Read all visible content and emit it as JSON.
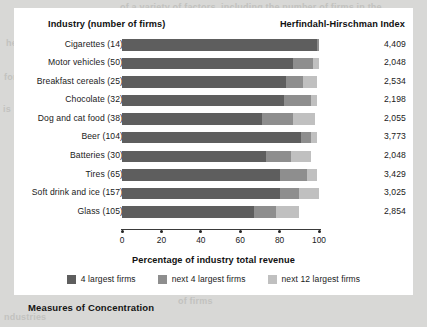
{
  "figure": {
    "caption": "Measures of Concentration",
    "header_left": "Industry (number of firms)",
    "header_right": "Herfindahl-Hirschman Index"
  },
  "colors": {
    "seg1": "#5e5e5e",
    "seg2": "#8e8e8e",
    "seg3": "#c0c0c0",
    "panel": "#ffffff",
    "page": "#d8d8d6",
    "text": "#1a1a1a"
  },
  "legend": [
    {
      "label": "4 largest firms",
      "color": "#5e5e5e",
      "key": "seg1"
    },
    {
      "label": "next 4 largest firms",
      "color": "#8e8e8e",
      "key": "seg2"
    },
    {
      "label": "next 12 largest firms",
      "color": "#c0c0c0",
      "key": "seg3"
    }
  ],
  "axis": {
    "title": "Percentage of industry total revenue",
    "ticks": [
      "0",
      "20",
      "40",
      "60",
      "80",
      "100"
    ],
    "min": 0,
    "max": 100
  },
  "chart_data": {
    "type": "bar",
    "orientation": "horizontal",
    "stacked": true,
    "title": "Measures of Concentration",
    "xlabel": "Percentage of industry total revenue",
    "ylabel": "Industry (number of firms)",
    "xlim": [
      0,
      100
    ],
    "xticks": [
      0,
      20,
      40,
      60,
      80,
      100
    ],
    "grid": false,
    "legend_position": "bottom",
    "categories": [
      "Cigarettes (14)",
      "Motor vehicles (50)",
      "Breakfast cereals (25)",
      "Chocolate (32)",
      "Dog and cat food (38)",
      "Beer (104)",
      "Batteries (30)",
      "Tires (65)",
      "Soft drink and ice (157)",
      "Glass (105)"
    ],
    "series": [
      {
        "name": "4 largest firms",
        "values": [
          99,
          87,
          83,
          82,
          71,
          91,
          73,
          80,
          80,
          67
        ]
      },
      {
        "name": "next 4 largest firms",
        "values": [
          1,
          10,
          9,
          14,
          16,
          5,
          13,
          14,
          10,
          11
        ]
      },
      {
        "name": "next 12 largest firms",
        "values": [
          0,
          3,
          7,
          3,
          11,
          3,
          10,
          5,
          10,
          12
        ]
      }
    ],
    "annotation_column": {
      "header": "Herfindahl-Hirschman Index",
      "values": [
        "4,409",
        "2,048",
        "2,534",
        "2,198",
        "2,055",
        "3,773",
        "2,048",
        "3,429",
        "3,025",
        "2,854"
      ]
    }
  },
  "bleed_text": [
    {
      "t": "of a variety of factors, including the number of firms in the",
      "x": 120,
      "y": 2
    },
    {
      "t": "he",
      "x": 6,
      "y": 38
    },
    {
      "t": "and the increasing",
      "x": 196,
      "y": 22
    },
    {
      "t": "for",
      "x": 4,
      "y": 72
    },
    {
      "t": "is",
      "x": 3,
      "y": 104
    },
    {
      "t": "are the two ways of",
      "x": 230,
      "y": 151
    },
    {
      "t": "are the features that",
      "x": 232,
      "y": 202
    },
    {
      "t": "of firms",
      "x": 178,
      "y": 296
    },
    {
      "t": "ndustries",
      "x": 4,
      "y": 312
    }
  ]
}
